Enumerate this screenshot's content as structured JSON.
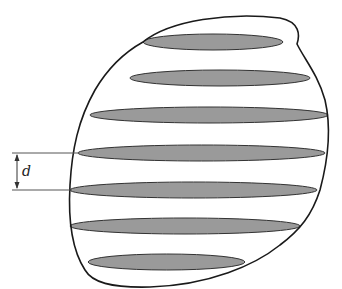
{
  "diagram": {
    "dimension_label": "d",
    "colors": {
      "outline": "#1a1a1a",
      "slice_fill": "#9a9a9a",
      "slice_stroke": "#333333",
      "dimension_line": "#555555"
    },
    "slices": [
      {
        "cy": 42,
        "x1": 143,
        "x2": 283
      },
      {
        "cy": 78,
        "x1": 130,
        "x2": 310
      },
      {
        "cy": 115,
        "x1": 90,
        "x2": 328
      },
      {
        "cy": 153,
        "x1": 78,
        "x2": 325
      },
      {
        "cy": 190,
        "x1": 70,
        "x2": 317
      },
      {
        "cy": 226,
        "x1": 70,
        "x2": 300
      },
      {
        "cy": 262,
        "x1": 88,
        "x2": 245
      }
    ],
    "slice_count": 7
  }
}
